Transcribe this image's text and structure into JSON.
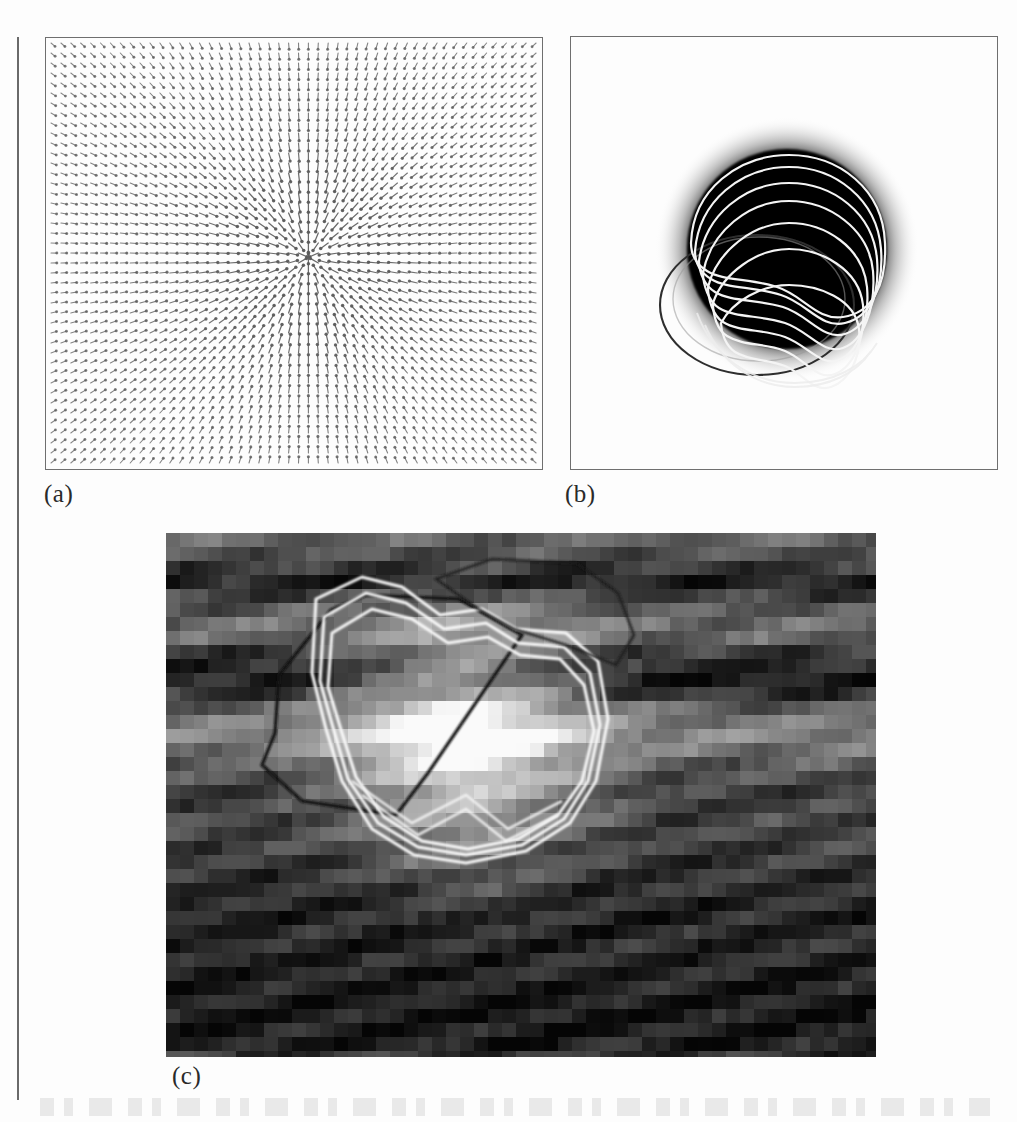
{
  "figure": {
    "panels": [
      {
        "id": "a",
        "label": "(a)",
        "name": "gvf-vector-field-panel",
        "kind": "quiver",
        "description": "Gradient vector flow field converging toward a central singularity"
      },
      {
        "id": "b",
        "label": "(b)",
        "name": "blob-contour-evolution-panel",
        "kind": "image-with-contours",
        "description": "Dark circular blob with iterative deformable contours and an initial circle"
      },
      {
        "id": "c",
        "label": "(c)",
        "name": "ultrasound-lesion-segmentation-panel",
        "kind": "image-with-contours",
        "description": "Pixelated grayscale ultrasound image with white iteration contours and a dark initial polygon"
      }
    ]
  },
  "chart_data": [
    {
      "type": "quiver",
      "name": "panel-a-vector-field",
      "title": "(a)",
      "grid_cols": 50,
      "grid_rows": 43,
      "cell_size_px": 10,
      "singularity": {
        "x_frac": 0.53,
        "y_frac": 0.51
      },
      "field": "radially inward (arrows point toward the center sink)",
      "arrow_color": "#5a5a5a",
      "frame_color": "#6f6f6f",
      "xlim": [
        0,
        50
      ],
      "ylim": [
        0,
        43
      ],
      "grid": false,
      "legend": "none"
    },
    {
      "type": "contour",
      "name": "panel-b-blob-contours",
      "title": "(b)",
      "blob": {
        "cx_frac": 0.51,
        "cy_frac": 0.49,
        "r_frac": 0.28,
        "fill": "#050505",
        "halo": "#9a9a9a"
      },
      "initial_contour": {
        "label": "initial circle",
        "color": "#303030",
        "cx_frac": 0.44,
        "cy_frac": 0.63,
        "rx_frac": 0.23,
        "ry_frac": 0.16
      },
      "iteration_contours": {
        "label": "snake iterations",
        "color": "#f2f2f2",
        "count": 7
      },
      "frame_color": "#6f6f6f",
      "grid": false,
      "legend": "none"
    },
    {
      "type": "contour",
      "name": "panel-c-lesion-contours",
      "title": "(c)",
      "image": "pixelated grayscale ultrasound, horizontal speckle banding, bright lesion center",
      "pixel_block_px": 14,
      "initial_contour": {
        "label": "initial polygon",
        "color": "#161616",
        "vertices": 9
      },
      "iteration_contours": {
        "label": "converged contours",
        "color": "#f8f8f8",
        "count": 3
      },
      "grid": false,
      "legend": "none"
    }
  ]
}
